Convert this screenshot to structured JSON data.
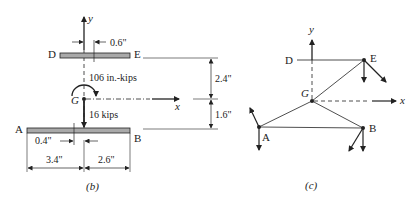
{
  "figure_b": {
    "caption": "(b)",
    "labels": {
      "D": "D",
      "E": "E",
      "A": "A",
      "B": "B",
      "G": "G",
      "x": "x",
      "y": "y"
    },
    "moment": "106 in.-kips",
    "force": "16 kips",
    "dimensions": {
      "de_offset": "0.6\"",
      "ab_offset": "0.4\"",
      "left_span": "3.4\"",
      "right_span": "2.6\"",
      "upper_height": "2.4\"",
      "lower_height": "1.6\""
    }
  },
  "figure_c": {
    "caption": "(c)",
    "labels": {
      "D": "D",
      "E": "E",
      "A": "A",
      "B": "B",
      "G": "G",
      "x": "x",
      "y": "y"
    }
  },
  "colors": {
    "ink": "#222222",
    "bar_fill": "#a9a9a9"
  }
}
